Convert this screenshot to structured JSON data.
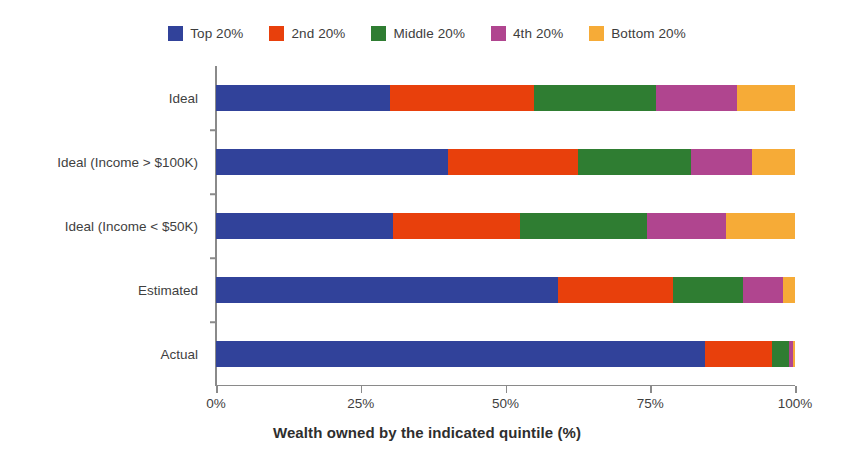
{
  "chart_data": {
    "type": "bar",
    "orientation": "horizontal",
    "stacked": true,
    "normalized": true,
    "title": "",
    "xlabel": "Wealth owned by the indicated quintile (%)",
    "ylabel": "",
    "xlim": [
      0,
      100
    ],
    "xticks": [
      0,
      25,
      50,
      75,
      100
    ],
    "xticklabels": [
      "0%",
      "25%",
      "50%",
      "75%",
      "100%"
    ],
    "grid": false,
    "legend_position": "top-center",
    "categories": [
      "Ideal",
      "Ideal (Income > $100K)",
      "Ideal (Income < $50K)",
      "Estimated",
      "Actual"
    ],
    "series": [
      {
        "name": "Top 20%",
        "color": "#31429a",
        "values": [
          30.0,
          40.0,
          30.5,
          59.0,
          84.5
        ]
      },
      {
        "name": "2nd 20%",
        "color": "#e8400c",
        "values": [
          25.0,
          22.5,
          22.0,
          20.0,
          11.5
        ]
      },
      {
        "name": "Middle 20%",
        "color": "#2f7d32",
        "values": [
          21.0,
          19.5,
          22.0,
          12.0,
          3.0
        ]
      },
      {
        "name": "4th 20%",
        "color": "#b0458f",
        "values": [
          14.0,
          10.5,
          13.5,
          7.0,
          0.6
        ]
      },
      {
        "name": "Bottom 20%",
        "color": "#f6ab37",
        "values": [
          10.0,
          7.5,
          12.0,
          2.0,
          0.4
        ]
      }
    ]
  },
  "legend": {
    "items": [
      {
        "label": "Top 20%"
      },
      {
        "label": "2nd 20%"
      },
      {
        "label": "Middle 20%"
      },
      {
        "label": "4th 20%"
      },
      {
        "label": "Bottom 20%"
      }
    ]
  },
  "axes": {
    "x_title": "Wealth owned by the indicated quintile (%)"
  }
}
